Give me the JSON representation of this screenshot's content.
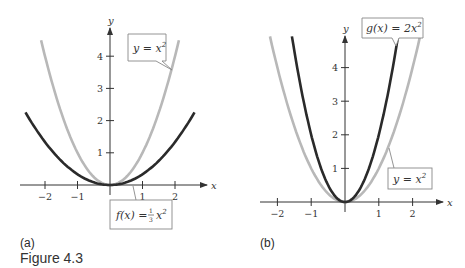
{
  "figure_caption": "Figure 4.3",
  "chart_data": [
    {
      "type": "line",
      "panel_label": "(a)",
      "xlabel": "x",
      "ylabel": "y",
      "x_ticks": [
        "−2",
        "−1",
        "1",
        "2"
      ],
      "y_ticks": [
        "1",
        "2",
        "3",
        "4"
      ],
      "xlim": [
        -2.6,
        3.0
      ],
      "ylim": [
        0,
        4.8
      ],
      "grid": false,
      "series": [
        {
          "name": "y = x^2",
          "label": "y = x²",
          "color": "#b8b8b8",
          "formula": "x^2",
          "x": [
            -2.1,
            -1.5,
            -1,
            -0.5,
            0,
            0.5,
            1,
            1.5,
            2.1
          ],
          "values": [
            4.41,
            2.25,
            1,
            0.25,
            0,
            0.25,
            1,
            2.25,
            4.41
          ]
        },
        {
          "name": "f(x) = (1/3)x^2",
          "label": "f(x) = ⅓x²",
          "color": "#2a2a2a",
          "formula": "x^2/3",
          "x": [
            -2.6,
            -2,
            -1,
            0,
            1,
            2,
            2.6
          ],
          "values": [
            2.25,
            1.33,
            0.33,
            0,
            0.33,
            1.33,
            2.25
          ]
        }
      ],
      "annotations": [
        {
          "text_main": "y = x",
          "superscript": "2"
        },
        {
          "text_main": "f(x) = ",
          "fraction_num": "1",
          "fraction_den": "3",
          "tail": "x",
          "superscript": "2"
        }
      ]
    },
    {
      "type": "line",
      "panel_label": "(b)",
      "xlabel": "x",
      "ylabel": "y",
      "x_ticks": [
        "−2",
        "−1",
        "1",
        "2"
      ],
      "y_ticks": [
        "1",
        "2",
        "3",
        "4"
      ],
      "xlim": [
        -2.6,
        2.9
      ],
      "ylim": [
        0,
        4.8
      ],
      "grid": false,
      "series": [
        {
          "name": "g(x) = 2x^2",
          "label": "g(x) = 2x²",
          "color": "#2a2a2a",
          "formula": "2x^2",
          "x": [
            -1.55,
            -1,
            -0.5,
            0,
            0.5,
            1,
            1.55
          ],
          "values": [
            4.8,
            2,
            0.5,
            0,
            0.5,
            2,
            4.8
          ]
        },
        {
          "name": "y = x^2",
          "label": "y = x²",
          "color": "#b8b8b8",
          "formula": "x^2",
          "x": [
            -2.2,
            -1.5,
            -1,
            0,
            1,
            1.5,
            2.2
          ],
          "values": [
            4.84,
            2.25,
            1,
            0,
            1,
            2.25,
            4.84
          ]
        }
      ],
      "annotations": [
        {
          "text_main": "g(x) = 2x",
          "superscript": "2"
        },
        {
          "text_main": "y = x",
          "superscript": "2"
        }
      ]
    }
  ]
}
